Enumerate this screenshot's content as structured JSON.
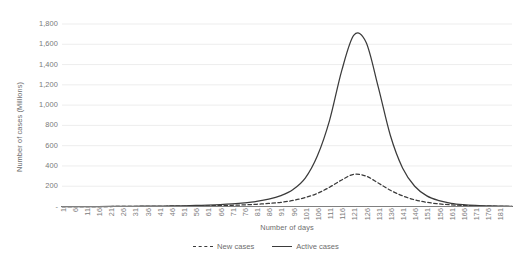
{
  "chart_data": {
    "type": "line",
    "title": "",
    "xlabel": "Number of days",
    "ylabel": "Number of cases (Millions)",
    "xlim": [
      1,
      186
    ],
    "ylim": [
      0,
      1800
    ],
    "grid": true,
    "legend_position": "bottom",
    "y_ticks": [
      "1,800",
      "1,600",
      "1,400",
      "1,200",
      "1,000",
      "800",
      "600",
      "400",
      "200",
      "-"
    ],
    "y_tick_values": [
      1800,
      1600,
      1400,
      1200,
      1000,
      800,
      600,
      400,
      200,
      0
    ],
    "x_ticks": [
      "1",
      "6",
      "11",
      "16",
      "21",
      "26",
      "31",
      "36",
      "41",
      "46",
      "51",
      "56",
      "61",
      "66",
      "71",
      "76",
      "81",
      "86",
      "91",
      "96",
      "101",
      "106",
      "111",
      "116",
      "121",
      "126",
      "131",
      "136",
      "141",
      "146",
      "151",
      "156",
      "161",
      "166",
      "171",
      "176",
      "181"
    ],
    "x": [
      1,
      6,
      11,
      16,
      21,
      26,
      31,
      36,
      41,
      46,
      51,
      56,
      61,
      66,
      71,
      76,
      81,
      86,
      91,
      96,
      101,
      106,
      111,
      116,
      121,
      126,
      131,
      136,
      141,
      146,
      151,
      156,
      161,
      166,
      171,
      176,
      181,
      186
    ],
    "series": [
      {
        "name": "New cases",
        "style": "dashed",
        "color": "#3b3b3b",
        "peak_x": 121,
        "peak_y": 320,
        "values": [
          0,
          0,
          0,
          0,
          0,
          1,
          1,
          2,
          2,
          3,
          4,
          5,
          7,
          9,
          12,
          16,
          22,
          30,
          41,
          60,
          88,
          130,
          190,
          262,
          318,
          300,
          232,
          160,
          105,
          66,
          41,
          26,
          16,
          10,
          6,
          4,
          2,
          1
        ]
      },
      {
        "name": "Active cases",
        "style": "solid",
        "color": "#3b3b3b",
        "peak_x": 122,
        "peak_y": 1700,
        "values": [
          0,
          0,
          0,
          0,
          1,
          1,
          2,
          3,
          4,
          5,
          7,
          10,
          14,
          19,
          26,
          36,
          50,
          72,
          108,
          168,
          280,
          500,
          850,
          1340,
          1690,
          1620,
          1180,
          700,
          380,
          200,
          105,
          58,
          32,
          18,
          10,
          6,
          3,
          2
        ]
      }
    ]
  },
  "legend": {
    "items": [
      {
        "label": "New cases",
        "style": "dashed"
      },
      {
        "label": "Active cases",
        "style": "solid"
      }
    ]
  }
}
